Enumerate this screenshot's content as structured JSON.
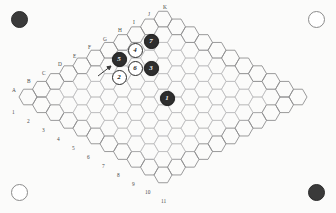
{
  "figure": {
    "board_shape": "rhombus-hex-grid",
    "grid": {
      "columns": 11,
      "rows": 11,
      "orientation": "flat-top"
    }
  },
  "corners": [
    {
      "position": "top-left",
      "name": "corner-marker-top-left",
      "fill": "dark",
      "color": "#3a3a3a"
    },
    {
      "position": "top-right",
      "name": "corner-marker-top-right",
      "fill": "light",
      "color": "#ffffff"
    },
    {
      "position": "bottom-left",
      "name": "corner-marker-bottom-left",
      "fill": "light",
      "color": "#ffffff"
    },
    {
      "position": "bottom-right",
      "name": "corner-marker-bottom-right",
      "fill": "dark",
      "color": "#3a3a3a"
    }
  ],
  "column_labels": [
    {
      "label": "A",
      "x": 12,
      "y": 88
    },
    {
      "label": "B",
      "x": 27,
      "y": 79
    },
    {
      "label": "C",
      "x": 42,
      "y": 71
    },
    {
      "label": "D",
      "x": 58,
      "y": 62
    },
    {
      "label": "E",
      "x": 73,
      "y": 54
    },
    {
      "label": "F",
      "x": 88,
      "y": 45
    },
    {
      "label": "G",
      "x": 103,
      "y": 37
    },
    {
      "label": "H",
      "x": 118,
      "y": 28
    },
    {
      "label": "I",
      "x": 133,
      "y": 20
    },
    {
      "label": "J",
      "x": 148,
      "y": 12
    },
    {
      "label": "K",
      "x": 163,
      "y": 5
    }
  ],
  "row_labels": [
    {
      "label": "1",
      "x": 12,
      "y": 110
    },
    {
      "label": "2",
      "x": 27,
      "y": 119
    },
    {
      "label": "3",
      "x": 42,
      "y": 128
    },
    {
      "label": "4",
      "x": 57,
      "y": 137
    },
    {
      "label": "5",
      "x": 72,
      "y": 146
    },
    {
      "label": "6",
      "x": 87,
      "y": 155
    },
    {
      "label": "7",
      "x": 102,
      "y": 164
    },
    {
      "label": "8",
      "x": 117,
      "y": 173
    },
    {
      "label": "9",
      "x": 132,
      "y": 182
    },
    {
      "label": "10",
      "x": 145,
      "y": 190
    },
    {
      "label": "11",
      "x": 161,
      "y": 199
    }
  ],
  "stones": [
    {
      "number": "1",
      "color": "black",
      "x": 167,
      "y": 98,
      "name": "stone-1"
    },
    {
      "number": "2",
      "color": "white",
      "x": 119,
      "y": 77,
      "name": "stone-2"
    },
    {
      "number": "3",
      "color": "black",
      "x": 151,
      "y": 68,
      "name": "stone-3"
    },
    {
      "number": "4",
      "color": "white",
      "x": 135,
      "y": 50,
      "name": "stone-4"
    },
    {
      "number": "5",
      "color": "black",
      "x": 119,
      "y": 59,
      "name": "stone-5"
    },
    {
      "number": "6",
      "color": "white",
      "x": 135,
      "y": 68,
      "name": "stone-6"
    },
    {
      "number": "7",
      "color": "black",
      "x": 151,
      "y": 41,
      "name": "stone-7"
    }
  ],
  "annotations": {
    "pointer_arrow": {
      "name": "pointer-arrow",
      "x1": 98,
      "y1": 76,
      "x2": 111,
      "y2": 66
    }
  },
  "colors": {
    "grid_line": "#b9b9bb",
    "grid_line_outer": "#8e8e90",
    "black_stone": "#2e2e2e",
    "white_stone": "#ffffff",
    "label_text": "#4b4b4b",
    "background": "#fbfbfa"
  }
}
